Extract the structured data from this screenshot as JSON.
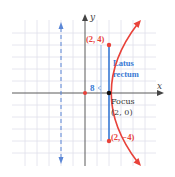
{
  "diagram": {
    "type": "parabola",
    "equation": "y^2 = 8x",
    "axes": {
      "x_label": "x",
      "y_label": "y"
    },
    "vertex": [
      0,
      0
    ],
    "focus": {
      "label": "Focus",
      "coords_label": "(2, 0)",
      "x": 2,
      "y": 0
    },
    "latus_rectum": {
      "label_line1": "Latus",
      "label_line2": "rectum",
      "length_label": "8"
    },
    "points": [
      {
        "label": "(2, 4)",
        "x": 2,
        "y": 4
      },
      {
        "label": "(2, −4)",
        "x": 2,
        "y": -4
      }
    ],
    "directrix": {
      "x": -2
    },
    "grid": {
      "unit_px": 12,
      "x_range": [
        -6,
        6
      ],
      "y_range": [
        -6,
        6
      ]
    },
    "colors": {
      "curve": "#e8423a",
      "point_label": "#e8423a",
      "latus_rectum": "#3a7bd5",
      "directrix": "#5a86d6",
      "axis": "#555555",
      "grid": "#dcdce8",
      "text": "#333333"
    }
  }
}
